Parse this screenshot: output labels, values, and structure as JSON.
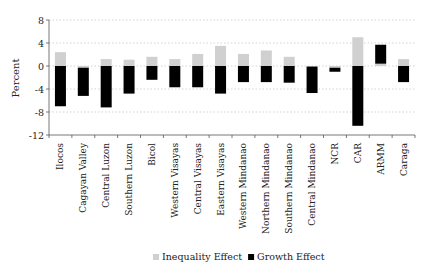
{
  "chart_data": {
    "type": "bar",
    "stacked": true,
    "title": "",
    "xlabel": "",
    "ylabel": "Percent",
    "ylim": [
      -12,
      8
    ],
    "yticks": [
      8,
      4,
      0,
      -4,
      -8,
      -12
    ],
    "grid": true,
    "legend_position": "bottom",
    "categories": [
      "Ilocos",
      "Cagayan Valley",
      "Central Luzon",
      "Southern Luzon",
      "Bicol",
      "Western Visayas",
      "Central Visayas",
      "Eastern Visayas",
      "Western Mindanao",
      "Northern Mindanao",
      "Southern Mindanao",
      "Central Mindanao",
      "NCR",
      "CAR",
      "ARMM",
      "Caraga"
    ],
    "series": [
      {
        "name": "Inequality Effect",
        "color": "#d0d0d0",
        "values": [
          2.4,
          -0.3,
          1.2,
          1.1,
          1.6,
          1.2,
          2.1,
          3.5,
          2.1,
          2.7,
          1.6,
          -0.1,
          -0.3,
          5.0,
          0.4,
          1.2
        ]
      },
      {
        "name": "Growth Effect",
        "color": "#000000",
        "values": [
          -7.0,
          -4.9,
          -7.2,
          -4.8,
          -2.4,
          -3.7,
          -3.7,
          -4.8,
          -2.8,
          -2.8,
          -2.9,
          -4.6,
          -0.7,
          -10.4,
          3.3,
          -2.8
        ]
      }
    ]
  },
  "legend": {
    "items": [
      {
        "label": "Inequality Effect",
        "color": "#d0d0d0"
      },
      {
        "label": "Growth Effect",
        "color": "#000000"
      }
    ]
  },
  "axis": {
    "ylabel": "Percent"
  }
}
